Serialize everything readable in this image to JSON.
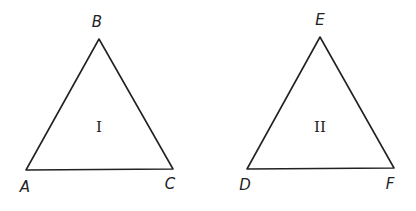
{
  "triangles": [
    {
      "name": "I",
      "vertices": {
        "A": [
          26,
          170
        ],
        "B": [
          99,
          39
        ],
        "C": [
          173,
          169
        ]
      },
      "labels": {
        "A": "A",
        "B": "B",
        "C": "C"
      },
      "roman": "I"
    },
    {
      "name": "II",
      "vertices": {
        "D": [
          247,
          169
        ],
        "E": [
          320,
          37
        ],
        "F": [
          394,
          168
        ]
      },
      "labels": {
        "D": "D",
        "E": "E",
        "F": "F"
      },
      "roman": "II"
    }
  ],
  "stroke_color": "#222222"
}
